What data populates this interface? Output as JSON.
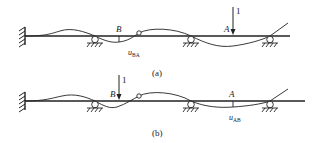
{
  "diagram": {
    "colors": {
      "ink": "#222222",
      "background": "#ffffff"
    },
    "panels": [
      {
        "id": "a",
        "caption": "(a)",
        "beam_y": 36,
        "points": {
          "B": {
            "label": "B",
            "x": 119
          },
          "A": {
            "label": "A",
            "x": 233
          }
        },
        "load": {
          "label": "1",
          "at": "A"
        },
        "displacement_label": {
          "main": "u",
          "sub": "BA",
          "at": "B"
        }
      },
      {
        "id": "b",
        "caption": "(b)",
        "beam_y": 101,
        "points": {
          "B": {
            "label": "B",
            "x": 119
          },
          "A": {
            "label": "A",
            "x": 233
          }
        },
        "load": {
          "label": "1",
          "at": "B"
        },
        "displacement_label": {
          "main": "u",
          "sub": "AB",
          "at": "A"
        }
      }
    ],
    "supports": {
      "fixed_x": 25,
      "rollers_x": [
        95,
        191,
        270
      ],
      "hinge_x": 139
    }
  }
}
